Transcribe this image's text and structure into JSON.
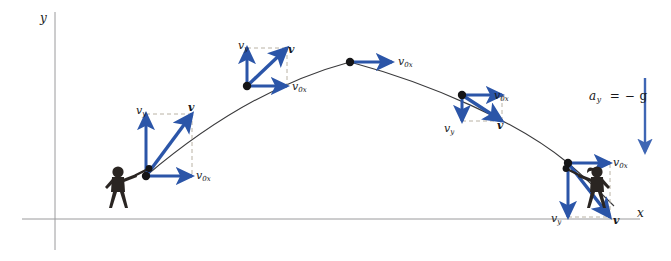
{
  "figure": {
    "type": "projectile-motion-diagram",
    "background_color": "#ffffff",
    "vector_color": "#2b55a8",
    "curve_color": "#3a3a3c",
    "axis_color": "#9a9a9c",
    "dash_color": "#b9b2a4",
    "figure_color": "#2a2522"
  },
  "axes": {
    "y_label": "y",
    "x_label": "x",
    "y_axis": {
      "x": 55,
      "y_top": 12,
      "y_bottom": 250
    },
    "x_axis": {
      "y": 219,
      "x_left": 22,
      "x_right": 640
    }
  },
  "gravity": {
    "label_a": "a",
    "label_sub": "y",
    "label_rest": "= − g",
    "full_label": "a_y = − g",
    "arrow": {
      "x": 645,
      "y_start": 78,
      "y_end": 152,
      "direction": "down"
    }
  },
  "trajectory": {
    "launch_point": {
      "x": 146,
      "y": 176
    },
    "apex_point": {
      "x": 350,
      "y": 62
    },
    "landing_point": {
      "x": 568,
      "y": 163
    },
    "path": "M146,176 C200,130 268,84 350,62 C432,84 518,122 568,163 C590,182 604,196 614,206"
  },
  "labels": {
    "vy": "v",
    "vy_sub": "y",
    "v0x": "v",
    "v0x_sub": "0x",
    "v": "v"
  },
  "points": [
    {
      "id": "launch",
      "name": "launch-point",
      "x": 146,
      "y": 176,
      "phase": "ascending",
      "vectors": [
        {
          "name": "vy",
          "label": "v",
          "sub": "y",
          "dx": 0,
          "dy": -62,
          "label_x": 136,
          "label_y": 105
        },
        {
          "name": "v0x",
          "label": "v",
          "sub": "0x",
          "dx": 46,
          "dy": 0,
          "label_x": 196,
          "label_y": 170
        },
        {
          "name": "v",
          "label": "v",
          "sub": "",
          "dx": 46,
          "dy": -62,
          "label_x": 188,
          "label_y": 102
        }
      ],
      "dashes": [
        {
          "x1": 146,
          "y1": 114,
          "x2": 192,
          "y2": 114
        },
        {
          "x1": 192,
          "y1": 114,
          "x2": 192,
          "y2": 176
        }
      ]
    },
    {
      "id": "ascend",
      "name": "ascending-point",
      "x": 247,
      "y": 86,
      "phase": "ascending",
      "vectors": [
        {
          "name": "vy",
          "label": "v",
          "sub": "y",
          "dx": 0,
          "dy": -38,
          "label_x": 238,
          "label_y": 40
        },
        {
          "name": "v0x",
          "label": "v",
          "sub": "0x",
          "dx": 40,
          "dy": 0,
          "label_x": 292,
          "label_y": 81
        },
        {
          "name": "v",
          "label": "v",
          "sub": "",
          "dx": 40,
          "dy": -38,
          "label_x": 288,
          "label_y": 44
        }
      ],
      "dashes": [
        {
          "x1": 247,
          "y1": 48,
          "x2": 287,
          "y2": 48
        },
        {
          "x1": 287,
          "y1": 48,
          "x2": 287,
          "y2": 86
        }
      ]
    },
    {
      "id": "apex",
      "name": "apex-point",
      "x": 350,
      "y": 62,
      "phase": "apex",
      "vectors": [
        {
          "name": "v0x",
          "label": "v",
          "sub": "0x",
          "dx": 42,
          "dy": 0,
          "label_x": 398,
          "label_y": 56
        }
      ],
      "dashes": []
    },
    {
      "id": "descend",
      "name": "descending-point",
      "x": 462,
      "y": 95,
      "phase": "descending",
      "vectors": [
        {
          "name": "v0x",
          "label": "v",
          "sub": "0x",
          "dx": 40,
          "dy": 0,
          "label_x": 494,
          "label_y": 90
        },
        {
          "name": "vy",
          "label": "v",
          "sub": "y",
          "dx": 0,
          "dy": 26,
          "label_x": 444,
          "label_y": 123
        },
        {
          "name": "v",
          "label": "v",
          "sub": "",
          "dx": 40,
          "dy": 26,
          "label_x": 497,
          "label_y": 120
        }
      ],
      "dashes": [
        {
          "x1": 462,
          "y1": 121,
          "x2": 502,
          "y2": 121
        },
        {
          "x1": 502,
          "y1": 121,
          "x2": 502,
          "y2": 95
        }
      ]
    },
    {
      "id": "landing",
      "name": "landing-point",
      "x": 568,
      "y": 163,
      "phase": "landing",
      "vectors": [
        {
          "name": "v0x",
          "label": "v",
          "sub": "0x",
          "dx": 42,
          "dy": 0,
          "label_x": 613,
          "label_y": 157
        },
        {
          "name": "vy",
          "label": "v",
          "sub": "y",
          "dx": 0,
          "dy": 54,
          "label_x": 551,
          "label_y": 213
        },
        {
          "name": "v",
          "label": "v",
          "sub": "",
          "dx": 42,
          "dy": 54,
          "label_x": 613,
          "label_y": 215
        }
      ],
      "dashes": [
        {
          "x1": 568,
          "y1": 217,
          "x2": 610,
          "y2": 217
        },
        {
          "x1": 610,
          "y1": 217,
          "x2": 610,
          "y2": 163
        }
      ]
    }
  ],
  "figures": [
    {
      "id": "batter",
      "name": "batter-figure",
      "x": 118,
      "y": 196,
      "facing": "right",
      "holds": "bat"
    },
    {
      "id": "catcher",
      "name": "catcher-figure",
      "x": 597,
      "y": 196,
      "facing": "left",
      "holds": "bat"
    }
  ]
}
